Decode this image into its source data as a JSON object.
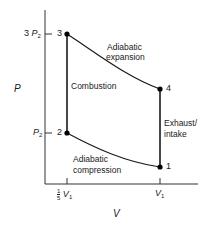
{
  "diagram": {
    "type": "PV diagram (Otto cycle)",
    "axes": {
      "y_label": "P",
      "x_label": "V",
      "y_ticks": [
        {
          "coef": "3",
          "symbol": "P",
          "sub": "2"
        },
        {
          "coef": "",
          "symbol": "P",
          "sub": "2"
        }
      ],
      "x_ticks": [
        {
          "frac_num": "1",
          "frac_den": "5",
          "symbol": "V",
          "sub": "1"
        },
        {
          "symbol": "V",
          "sub": "1"
        }
      ]
    },
    "points": [
      {
        "id": "1",
        "label": "1"
      },
      {
        "id": "2",
        "label": "2"
      },
      {
        "id": "3",
        "label": "3"
      },
      {
        "id": "4",
        "label": "4"
      }
    ],
    "processes": {
      "expansion": {
        "line1": "Adiabatic",
        "line2": "expansion"
      },
      "combustion": {
        "label": "Combustion"
      },
      "exhaust": {
        "line1": "Exhaust/",
        "line2": "intake"
      },
      "compression": {
        "line1": "Adiabatic",
        "line2": "compression"
      }
    },
    "colors": {
      "line": "#1a1a1a",
      "background": "#ffffff"
    }
  }
}
